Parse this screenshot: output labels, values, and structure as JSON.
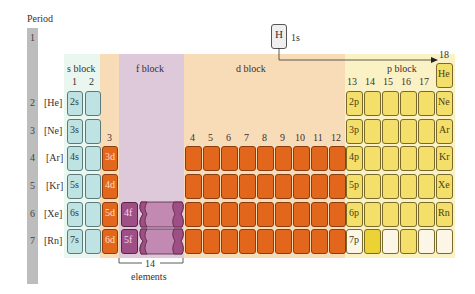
{
  "axis": {
    "period_label": "Period",
    "periods": [
      "1",
      "2",
      "3",
      "4",
      "5",
      "6",
      "7"
    ]
  },
  "noble_cores": [
    "[He]",
    "[Ne]",
    "[Ar]",
    "[Kr]",
    "[Xe]",
    "[Rn]"
  ],
  "blocks": {
    "s": {
      "label": "s block",
      "groups": [
        "1",
        "2"
      ],
      "subshells": [
        "2s",
        "3s",
        "4s",
        "5s",
        "6s",
        "7s"
      ],
      "color": "#bfe3e2"
    },
    "f": {
      "label": "f block",
      "subshells": [
        "4f",
        "5f"
      ],
      "color": "#a04f86"
    },
    "d": {
      "label": "d block",
      "group3": "3",
      "groups": [
        "4",
        "5",
        "6",
        "7",
        "8",
        "9",
        "10",
        "11",
        "12"
      ],
      "subshells": [
        "3d",
        "4d",
        "5d",
        "6d"
      ],
      "color": "#e2661c"
    },
    "p": {
      "label": "p block",
      "groups": [
        "13",
        "14",
        "15",
        "16",
        "17"
      ],
      "group18": "18",
      "subshells": [
        "2p",
        "3p",
        "4p",
        "5p",
        "6p",
        "7p"
      ],
      "color": "#f3df6a"
    }
  },
  "hydrogen": {
    "symbol": "H",
    "subshell": "1s"
  },
  "noble_gases": [
    "He",
    "Ne",
    "Ar",
    "Kr",
    "Xe",
    "Rn"
  ],
  "f_annotation": {
    "count": "14",
    "label": "elements"
  }
}
